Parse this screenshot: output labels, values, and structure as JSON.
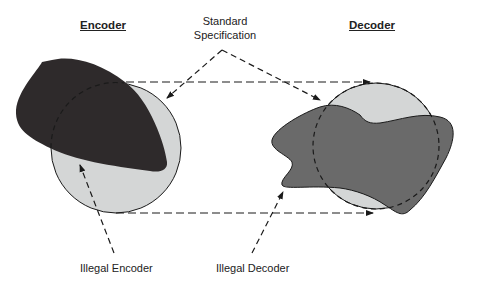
{
  "labels": {
    "encoder_title": "Encoder",
    "decoder_title": "Decoder",
    "standard_spec_line1": "Standard",
    "standard_spec_line2": "Specification",
    "illegal_encoder": "Illegal Encoder",
    "illegal_decoder": "Illegal Decoder"
  },
  "colors": {
    "circle_fill": "#d4d6d6",
    "encoder_blob": "#2e2a2b",
    "decoder_blob": "#6a6a6a",
    "stroke": "#1a1a1a"
  }
}
